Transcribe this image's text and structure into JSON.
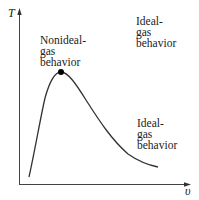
{
  "diagram": {
    "type": "T-v diagram",
    "axes": {
      "y_label": "T",
      "x_label": "υ"
    },
    "labels": {
      "nonideal": "Nonideal-\ngas\nbehavior",
      "ideal_top": "Ideal-\ngas\nbehavior",
      "ideal_right": "Ideal-\ngas\nbehavior"
    },
    "colors": {
      "line": "#333333",
      "text": "#222222",
      "critical_point": "#000000",
      "background": "#ffffff"
    },
    "curve": {
      "description": "saturation dome with critical point marked at peak",
      "start": [
        29,
        177
      ],
      "peak": [
        61,
        72
      ],
      "end": [
        158,
        167
      ]
    }
  }
}
